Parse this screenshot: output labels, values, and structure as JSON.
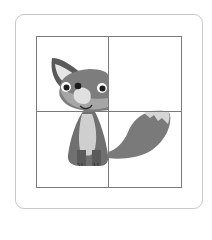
{
  "puzzle": {
    "type": "sliding-picture-puzzle",
    "grid": {
      "rows": 2,
      "cols": 2
    },
    "subject": "fox-cartoon",
    "tiles": [
      {
        "position": "top-left",
        "content": "fox-head-left"
      },
      {
        "position": "top-right",
        "content": "empty"
      },
      {
        "position": "bottom-left",
        "content": "fox-body"
      },
      {
        "position": "bottom-right",
        "content": "fox-tail"
      }
    ],
    "colors": {
      "card_border": "#c8c8c8",
      "grid_line": "#7a7a7a",
      "fur_dark": "#6e6e6e",
      "fur_mid": "#8a8a8a",
      "fur_light": "#d0d0d0",
      "background": "#ffffff"
    }
  }
}
